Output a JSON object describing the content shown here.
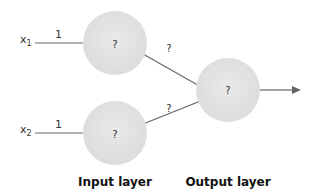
{
  "diagram": {
    "inputs": [
      {
        "name": "x",
        "subscript": "1",
        "weight": "1"
      },
      {
        "name": "x",
        "subscript": "2",
        "weight": "1"
      }
    ],
    "input_nodes": [
      {
        "label": "?"
      },
      {
        "label": "?"
      }
    ],
    "output_node": {
      "label": "?"
    },
    "hidden_to_output_weights": [
      "?",
      "?"
    ],
    "layers": {
      "input": "Input layer",
      "output": "Output layer"
    },
    "colors": {
      "node_fill": "#e3e3e3",
      "line": "#666666",
      "text": "#333333"
    }
  }
}
